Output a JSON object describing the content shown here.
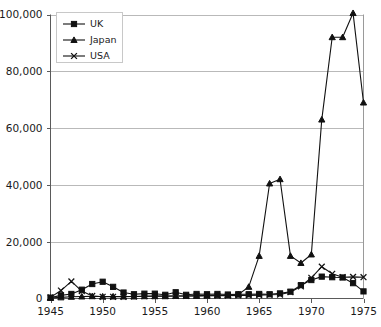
{
  "chart_data": {
    "type": "line",
    "title": "",
    "subtitle": "",
    "xlabel": "",
    "ylabel": "",
    "xlim": [
      1945,
      1975
    ],
    "ylim": [
      0,
      100000
    ],
    "xticks": [
      1945,
      1950,
      1955,
      1960,
      1965,
      1970,
      1975
    ],
    "yticks": [
      0,
      20000,
      40000,
      60000,
      80000,
      100000
    ],
    "ytick_labels": [
      "0",
      "20,000",
      "40,000",
      "60,000",
      "80,000",
      "100,000"
    ],
    "xtick_labels": [
      "1945",
      "1950",
      "1955",
      "1960",
      "1965",
      "1970",
      "1975"
    ],
    "grid": "horizontal",
    "legend_position": "top-left",
    "x": [
      1945,
      1946,
      1947,
      1948,
      1949,
      1950,
      1951,
      1952,
      1953,
      1954,
      1955,
      1956,
      1957,
      1958,
      1959,
      1960,
      1961,
      1962,
      1963,
      1964,
      1965,
      1966,
      1967,
      1968,
      1969,
      1970,
      1971,
      1972,
      1973,
      1974,
      1975
    ],
    "series": [
      {
        "name": "UK",
        "marker": "square",
        "values": [
          300,
          1100,
          1600,
          3100,
          5100,
          5900,
          4100,
          2100,
          1500,
          1700,
          1700,
          1300,
          2200,
          1300,
          1600,
          1500,
          1600,
          1400,
          1500,
          1500,
          1600,
          1500,
          1800,
          2400,
          4700,
          6500,
          7700,
          7500,
          7400,
          5400,
          2500
        ]
      },
      {
        "name": "Japan",
        "marker": "triangle",
        "values": [
          200,
          400,
          600,
          700,
          800,
          700,
          700,
          700,
          700,
          800,
          800,
          800,
          900,
          900,
          900,
          1000,
          1100,
          1200,
          1400,
          4100,
          15000,
          40500,
          42000,
          15000,
          12500,
          15500,
          63000,
          92000,
          92000,
          100500,
          69000
        ]
      },
      {
        "name": "USA",
        "marker": "cross",
        "values": [
          400,
          2800,
          6000,
          2600,
          900,
          600,
          600,
          600,
          700,
          800,
          900,
          900,
          900,
          900,
          1000,
          1000,
          1000,
          1000,
          1100,
          1100,
          1200,
          1300,
          1400,
          2200,
          4300,
          7300,
          11200,
          8700,
          7500,
          7600,
          7500
        ]
      }
    ]
  },
  "legend": {
    "items": [
      {
        "label": "UK",
        "marker": "square"
      },
      {
        "label": "Japan",
        "marker": "triangle"
      },
      {
        "label": "USA",
        "marker": "cross"
      }
    ]
  },
  "colors": {
    "series": "#111111",
    "grid": "#b9b9b9",
    "axis": "#5a5a5a",
    "text": "#1a1a1a",
    "background": "#ffffff"
  }
}
